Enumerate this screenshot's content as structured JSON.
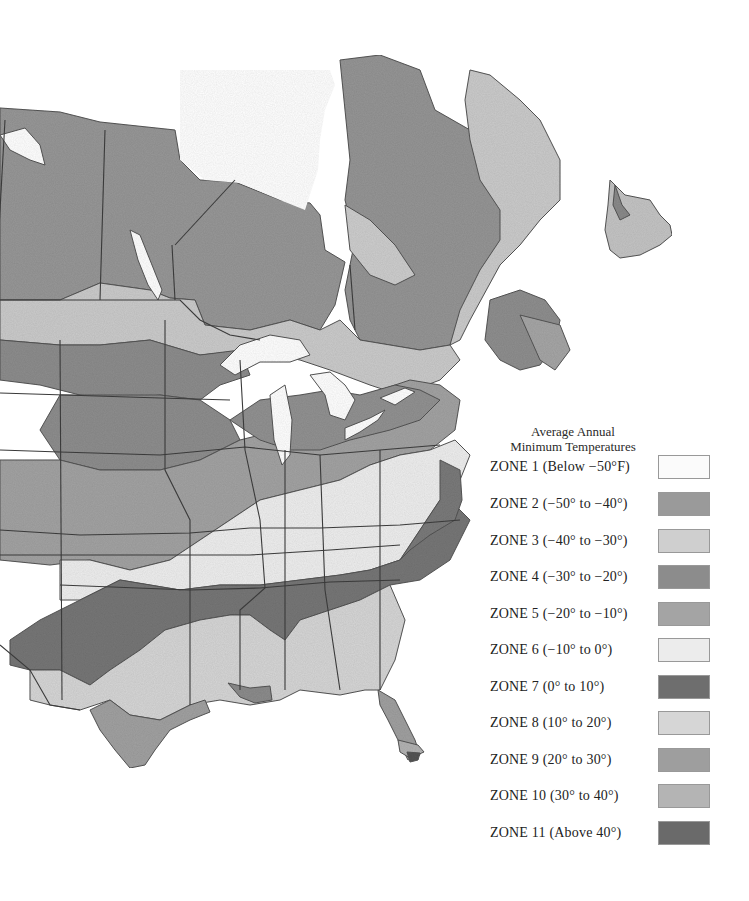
{
  "legend": {
    "title_line1": "Average Annual",
    "title_line2": "Minimum Temperatures",
    "zones": [
      {
        "label": "ZONE 1  (Below −50°F)",
        "color": "#fbfbfb"
      },
      {
        "label": "ZONE 2  (−50° to −40°)",
        "color": "#9a9a9a"
      },
      {
        "label": "ZONE 3  (−40° to −30°)",
        "color": "#cfcfcf"
      },
      {
        "label": "ZONE 4  (−30° to −20°)",
        "color": "#8c8c8c"
      },
      {
        "label": "ZONE 5  (−20° to −10°)",
        "color": "#a4a4a4"
      },
      {
        "label": "ZONE 6  (−10° to 0°)",
        "color": "#ececec"
      },
      {
        "label": "ZONE 7  (0° to 10°)",
        "color": "#6e6e6e"
      },
      {
        "label": "ZONE 8  (10° to 20°)",
        "color": "#d6d6d6"
      },
      {
        "label": "ZONE 9  (20° to 30°)",
        "color": "#9e9e9e"
      },
      {
        "label": "ZONE 10  (30° to 40°)",
        "color": "#b4b4b4"
      },
      {
        "label": "ZONE 11  (Above 40°)",
        "color": "#6a6a6a"
      }
    ]
  },
  "map": {
    "region": "North America (Canada and United States)",
    "water_color": "#ffffff",
    "border_color": "#3a3a3a"
  }
}
